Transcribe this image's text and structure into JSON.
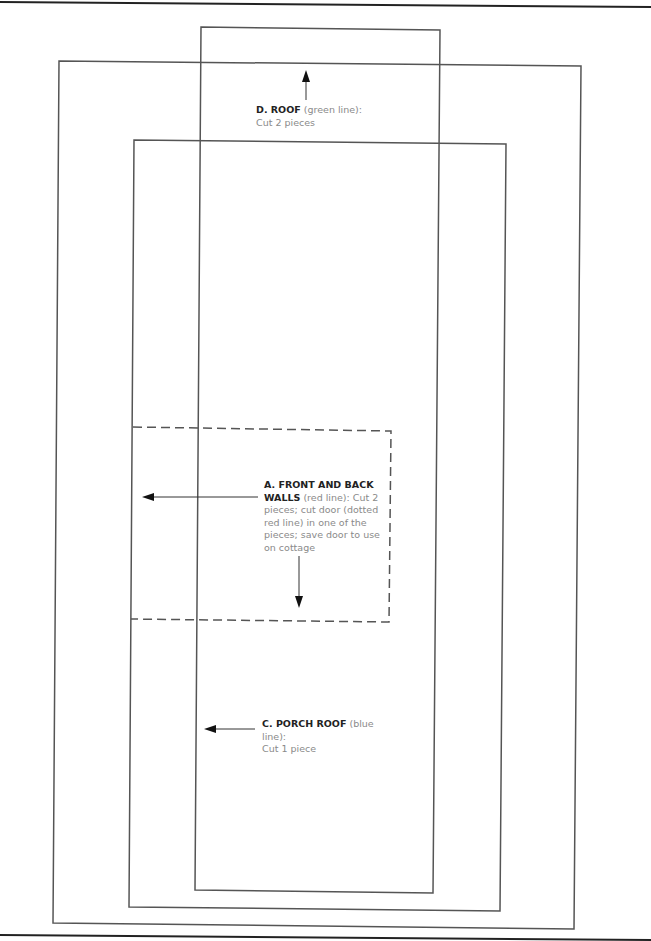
{
  "pattern": {
    "border_color": "#222222",
    "line_color": "#555555",
    "pieces": [
      {
        "id": "D",
        "title": "D. ROOF",
        "note": "(green line):",
        "instructions": "Cut 2 pieces",
        "outline": "solid"
      },
      {
        "id": "A",
        "title": "A. FRONT AND BACK WALLS",
        "title_line1": "A. FRONT AND BACK",
        "title_line2": "WALLS",
        "note": "(red line): Cut 2",
        "instructions_lines": [
          "pieces; cut door (dotted",
          "red line) in one of the",
          "pieces; save door to use",
          "on cottage"
        ],
        "outline": "solid",
        "door_outline": "dashed"
      },
      {
        "id": "C",
        "title": "C. PORCH ROOF",
        "note": "(blue line):",
        "instructions": "Cut 1 piece",
        "outline": "solid"
      }
    ]
  }
}
